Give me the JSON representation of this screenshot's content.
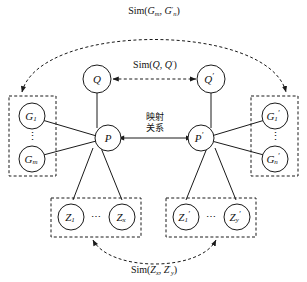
{
  "figure": {
    "background_color": "#ffffff",
    "stroke_color": "#1a1a1a"
  },
  "nodes": {
    "q_left": {
      "label": "Q",
      "prime": ""
    },
    "q_right": {
      "label": "Q",
      "prime": "′"
    },
    "p_left": {
      "label": "P",
      "prime": ""
    },
    "p_right": {
      "label": "P",
      "prime": "′"
    },
    "g_left_first": {
      "base": "G",
      "sub": "1",
      "prime": ""
    },
    "g_left_last": {
      "base": "G",
      "sub": "m",
      "prime": ""
    },
    "g_right_first": {
      "base": "G",
      "sub": "1",
      "prime": "′"
    },
    "g_right_last": {
      "base": "G",
      "sub": "n",
      "prime": "′"
    },
    "z_left_first": {
      "base": "Z",
      "sub": "1",
      "prime": ""
    },
    "z_left_last": {
      "base": "Z",
      "sub": "x",
      "prime": ""
    },
    "z_right_first": {
      "base": "Z",
      "sub": "1",
      "prime": "′"
    },
    "z_right_last": {
      "base": "Z",
      "sub": "y",
      "prime": "′"
    }
  },
  "ellipses": {
    "vertical": "⋮",
    "horizontal": "⋯"
  },
  "labels": {
    "sim_graph": {
      "prefix": "Sim(",
      "arg1_base": "G",
      "arg1_sub": "m",
      "arg1_prime": "",
      "separator": ", ",
      "arg2_base": "G",
      "arg2_sub": "n",
      "arg2_prime": "′",
      "suffix": ")",
      "full_text": "Sim(Gm, G′n)"
    },
    "sim_query": {
      "prefix": "Sim(",
      "arg1_base": "Q",
      "arg1_sub": "",
      "arg1_prime": "",
      "separator": ", ",
      "arg2_base": "Q",
      "arg2_sub": "",
      "arg2_prime": "′",
      "suffix": ")",
      "full_text": "Sim(Q, Q′)"
    },
    "sim_latent": {
      "prefix": "Sim(",
      "arg1_base": "Z",
      "arg1_sub": "x",
      "arg1_prime": "",
      "separator": ", ",
      "arg2_base": "Z",
      "arg2_sub": "y",
      "arg2_prime": "′",
      "suffix": ")",
      "full_text": "Sim(Zx, Z′y)"
    },
    "mapping_relation": {
      "line1": "映射",
      "line2": "关系",
      "full_text": "映射关系"
    }
  },
  "groups": {
    "g_left_box": "graph-set-left",
    "g_right_box": "graph-set-right",
    "z_left_box": "latent-set-left",
    "z_right_box": "latent-set-right"
  }
}
